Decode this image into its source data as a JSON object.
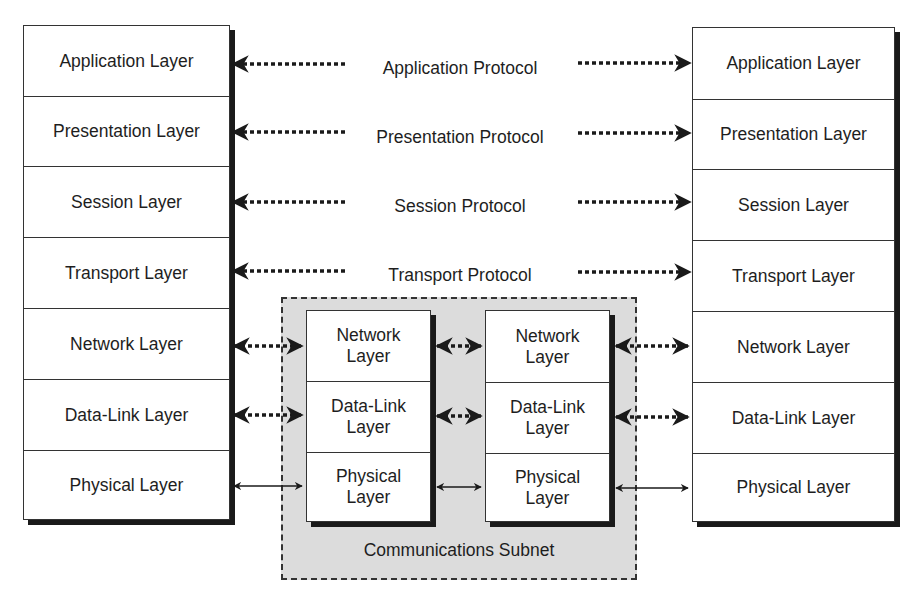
{
  "diagram": {
    "left_stack": {
      "layers": [
        "Application Layer",
        "Presentation Layer",
        "Session Layer",
        "Transport Layer",
        "Network Layer",
        "Data-Link Layer",
        "Physical Layer"
      ]
    },
    "right_stack": {
      "layers": [
        "Application Layer",
        "Presentation Layer",
        "Session Layer",
        "Transport Layer",
        "Network Layer",
        "Data-Link Layer",
        "Physical Layer"
      ]
    },
    "protocols": [
      "Application Protocol",
      "Presentation Protocol",
      "Session Protocol",
      "Transport Protocol"
    ],
    "subnet": {
      "label": "Communications Subnet",
      "node_a": {
        "layers": [
          "Network\nLayer",
          "Data-Link\nLayer",
          "Physical\nLayer"
        ]
      },
      "node_b": {
        "layers": [
          "Network\nLayer",
          "Data-Link\nLayer",
          "Physical\nLayer"
        ]
      }
    },
    "connections": {
      "dotted_peer_protocol": [
        "Application",
        "Presentation",
        "Session",
        "Transport",
        "Network",
        "Data-Link"
      ],
      "solid_physical": [
        "Physical"
      ]
    }
  }
}
